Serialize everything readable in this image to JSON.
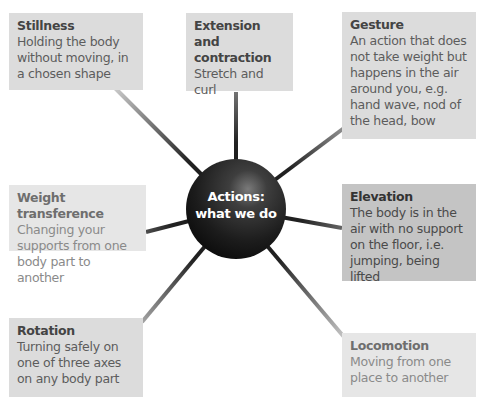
{
  "hub": {
    "line1": "Actions:",
    "line2": "what we do"
  },
  "nodes": [
    {
      "id": "stillness",
      "title": "Stillness",
      "description": "Holding the body without moving, in a chosen shape"
    },
    {
      "id": "extension",
      "title": "Extension and contraction",
      "description": "Stretch and curl"
    },
    {
      "id": "gesture",
      "title": "Gesture",
      "description": "An action that does not take weight but happens in the air around you, e.g. hand wave, nod of the head, bow"
    },
    {
      "id": "weight",
      "title": "Weight transference",
      "description": "Changing your supports from one body part to another"
    },
    {
      "id": "elevation",
      "title": "Elevation",
      "description": "The body is in the air with no support on the floor, i.e. jumping, being lifted"
    },
    {
      "id": "rotation",
      "title": "Rotation",
      "description": "Turning safely on one of three axes on any body part"
    },
    {
      "id": "locomotion",
      "title": "Locomotion",
      "description": "Moving from one place to another"
    }
  ],
  "colors": {
    "hub": "#1e1e1e",
    "box_mid": "#dcdcdc",
    "box_light": "#e6e6e6",
    "box_dark": "#c4c4c4"
  }
}
